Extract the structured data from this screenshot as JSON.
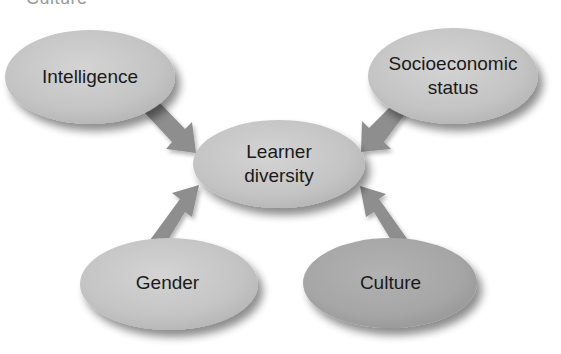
{
  "partial_header": {
    "text": "Culture"
  },
  "diagram": {
    "center": {
      "label_line1": "Learner",
      "label_line2": "diversity",
      "fill": "#c6c6c6"
    },
    "nodes": [
      {
        "id": "intelligence",
        "label_line1": "Intelligence",
        "label_line2": "",
        "fill": "#c6c6c6",
        "position": "top-left"
      },
      {
        "id": "socioeconomic",
        "label_line1": "Socioeconomic",
        "label_line2": "status",
        "fill": "#c6c6c6",
        "position": "top-right"
      },
      {
        "id": "gender",
        "label_line1": "Gender",
        "label_line2": "",
        "fill": "#cbcbcb",
        "position": "bottom-left"
      },
      {
        "id": "culture",
        "label_line1": "Culture",
        "label_line2": "",
        "fill": "#a9a9a9",
        "position": "bottom-right"
      }
    ],
    "arrow_color": "#8e8e8e",
    "edges": [
      {
        "from": "intelligence",
        "to": "center"
      },
      {
        "from": "socioeconomic",
        "to": "center"
      },
      {
        "from": "gender",
        "to": "center"
      },
      {
        "from": "culture",
        "to": "center"
      }
    ]
  }
}
